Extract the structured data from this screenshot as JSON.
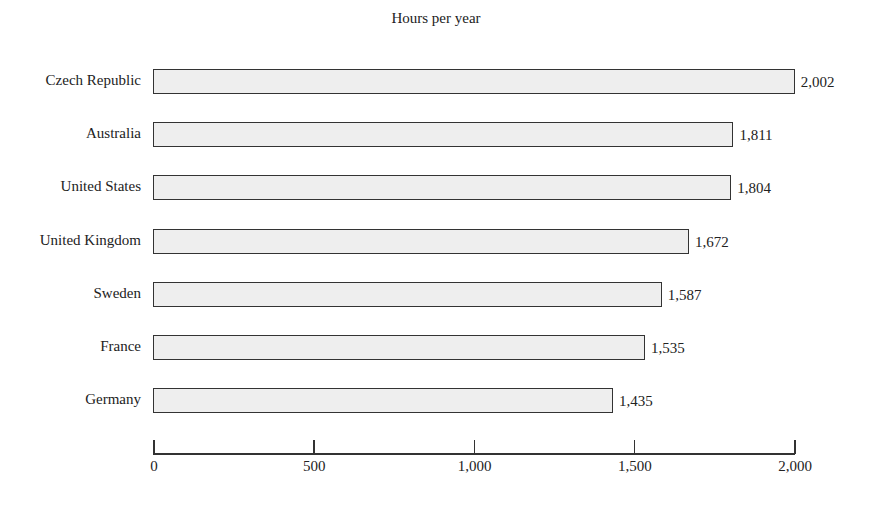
{
  "chart_data": {
    "type": "bar",
    "orientation": "horizontal",
    "title": "Hours per year",
    "xlabel": "",
    "ylabel": "",
    "categories": [
      "Czech Republic",
      "Australia",
      "United States",
      "United Kingdom",
      "Sweden",
      "France",
      "Germany"
    ],
    "values": [
      2002,
      1811,
      1804,
      1672,
      1587,
      1535,
      1435
    ],
    "value_labels": [
      "2,002",
      "1,811",
      "1,804",
      "1,672",
      "1,587",
      "1,535",
      "1,435"
    ],
    "xlim": [
      0,
      2000
    ],
    "x_ticks": [
      0,
      500,
      1000,
      1500,
      2000
    ],
    "x_tick_labels": [
      "0",
      "500",
      "1,000",
      "1,500",
      "2,000"
    ],
    "grid": false,
    "legend": null,
    "colors": {
      "bar_fill": "#eeeeee",
      "bar_border": "#333333"
    }
  }
}
